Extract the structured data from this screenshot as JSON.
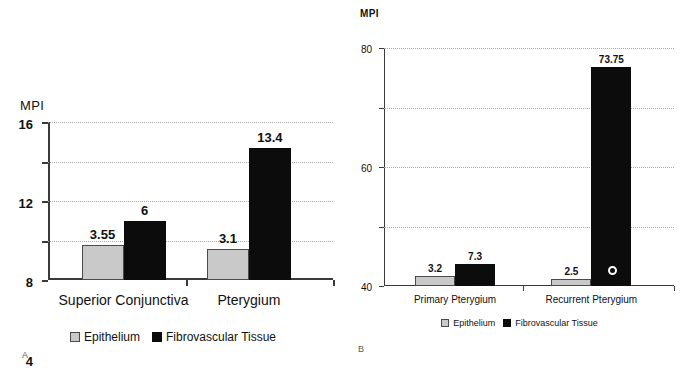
{
  "figure": {
    "panels": [
      {
        "letter": "A",
        "axis_title": "MPI",
        "legend": [
          {
            "label": "Epithelium",
            "swatch": "epithelium"
          },
          {
            "label": "Fibrovascular Tissue",
            "swatch": "fibro"
          }
        ]
      },
      {
        "letter": "B",
        "axis_title": "MPI",
        "legend": [
          {
            "label": "Epithelium",
            "swatch": "epithelium"
          },
          {
            "label": "Fibrovascular Tissue",
            "swatch": "fibro"
          }
        ]
      }
    ]
  },
  "chart_data": [
    {
      "type": "bar",
      "title": "",
      "panel": "A",
      "xlabel": "",
      "ylabel": "MPI",
      "ylim": [
        0,
        16
      ],
      "yticks": [
        0,
        4,
        8,
        12,
        16
      ],
      "grid": true,
      "legend_position": "bottom",
      "categories": [
        "Superior Conjunctiva",
        "Pterygium"
      ],
      "series": [
        {
          "name": "Epithelium",
          "values": [
            3.55,
            3.1
          ],
          "color": "#c9c9c9"
        },
        {
          "name": "Fibrovascular Tissue",
          "values": [
            6,
            13.4
          ],
          "color": "#0c0c0c"
        }
      ],
      "data_labels": [
        [
          "3.55",
          "6"
        ],
        [
          "3.1",
          "13.4"
        ]
      ]
    },
    {
      "type": "bar",
      "title": "",
      "panel": "B",
      "xlabel": "",
      "ylabel": "MPI",
      "ylim": [
        0,
        80
      ],
      "yticks": [
        0,
        20,
        40,
        60,
        80
      ],
      "grid": true,
      "legend_position": "bottom",
      "categories": [
        "Primary Pterygium",
        "Recurrent Pterygium"
      ],
      "series": [
        {
          "name": "Epithelium",
          "values": [
            3.2,
            2.5
          ],
          "color": "#c9c9c9"
        },
        {
          "name": "Fibrovascular Tissue",
          "values": [
            7.3,
            73.75
          ],
          "color": "#0c0c0c"
        }
      ],
      "data_labels": [
        [
          "3.2",
          "7.3"
        ],
        [
          "2.5",
          "73.75"
        ]
      ]
    }
  ]
}
